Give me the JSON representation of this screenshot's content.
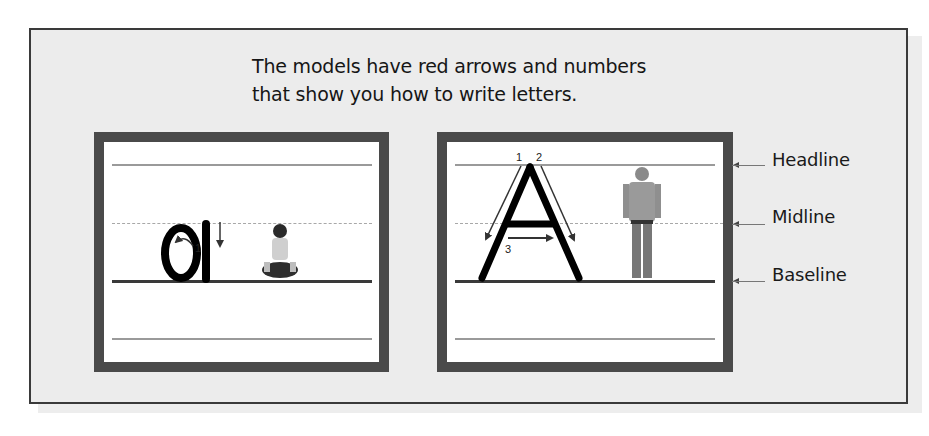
{
  "intro": {
    "line1": "The models have red arrows and numbers",
    "line2": "that show you how to write letters."
  },
  "left_model": {
    "letter": "a",
    "stroke_numbers": [
      "1"
    ],
    "photo": "seated-child-photo"
  },
  "right_model": {
    "letter": "A",
    "stroke_numbers": [
      "1",
      "2",
      "3"
    ],
    "photo": "standing-boy-photo"
  },
  "guide_labels": {
    "headline": "Headline",
    "midline": "Midline",
    "baseline": "Baseline"
  },
  "colors": {
    "panel_bg": "#ececec",
    "frame": "#4a4a4a",
    "letter": "#000000",
    "arrow": "#333333"
  }
}
